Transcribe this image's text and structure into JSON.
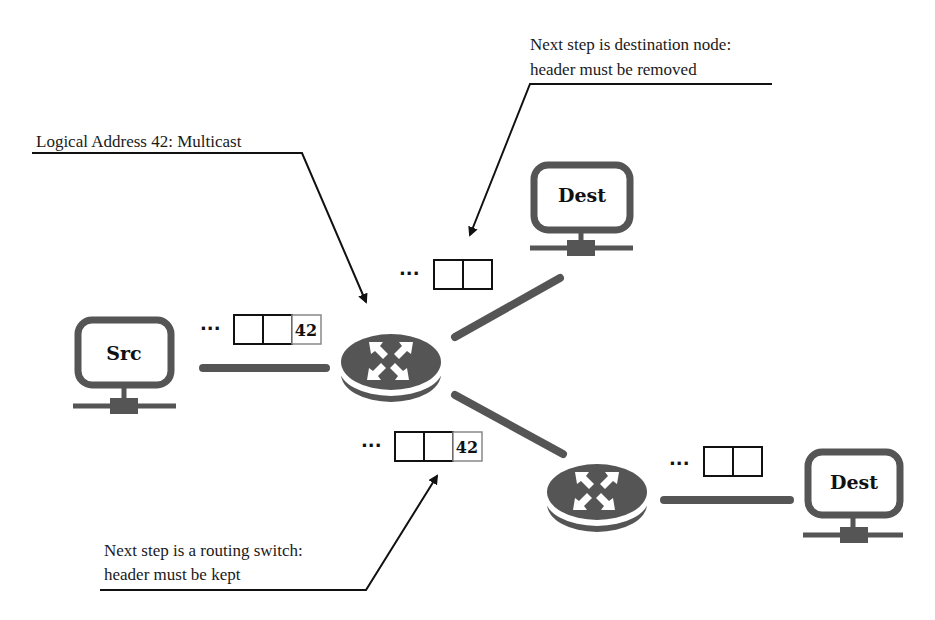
{
  "annotations": {
    "dest_note": {
      "line1": "Next step is destination node:",
      "line2": "header must be removed"
    },
    "multicast_note": {
      "line1": "Logical Address 42: Multicast"
    },
    "switch_note": {
      "line1": "Next step is a routing switch:",
      "line2": "header must be kept"
    }
  },
  "nodes": {
    "src": {
      "label": "Src"
    },
    "dest_top": {
      "label": "Dest"
    },
    "dest_bottom": {
      "label": "Dest"
    }
  },
  "packets": {
    "src_packet": {
      "ellipsis": "···",
      "cells": [
        "",
        "",
        "42"
      ]
    },
    "top_packet": {
      "ellipsis": "···",
      "cells": [
        "",
        ""
      ]
    },
    "middle_packet": {
      "ellipsis": "···",
      "cells": [
        "",
        "",
        "42"
      ]
    },
    "right_packet": {
      "ellipsis": "···",
      "cells": [
        "",
        ""
      ]
    }
  },
  "colors": {
    "device": "#555555",
    "link": "#555555",
    "line": "#111111"
  }
}
